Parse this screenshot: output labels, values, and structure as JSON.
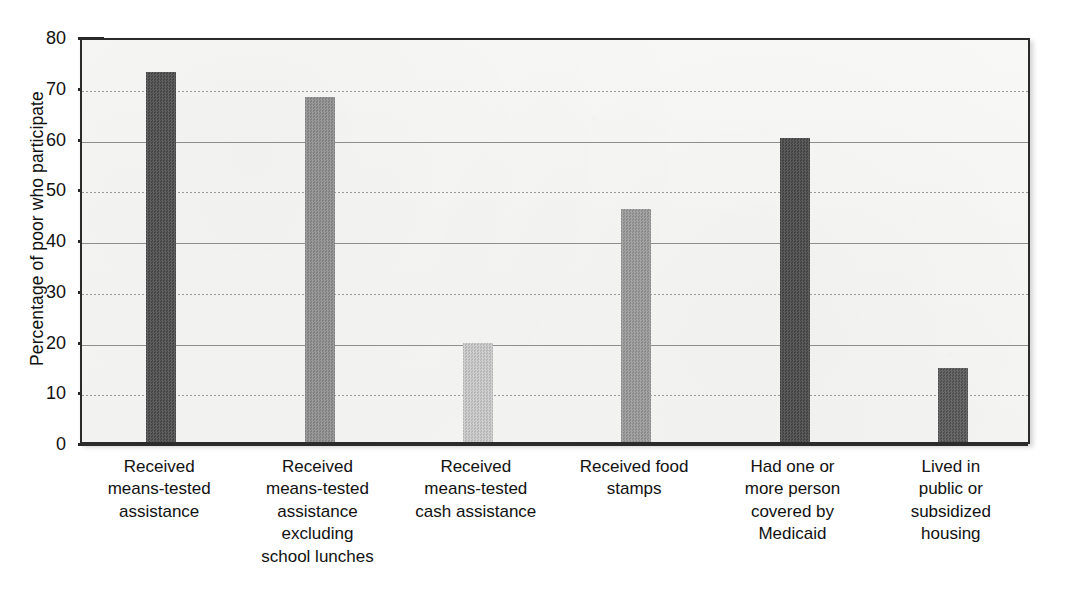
{
  "chart_data": {
    "type": "bar",
    "title": "",
    "xlabel": "",
    "ylabel": "Percentage of poor who participate",
    "ylim": [
      0,
      80
    ],
    "ytick_values": [
      0,
      10,
      20,
      30,
      40,
      50,
      60,
      70,
      80
    ],
    "ytick_labels": [
      "0",
      "10",
      "20",
      "30",
      "40",
      "50",
      "60",
      "70",
      "80"
    ],
    "grid": true,
    "grid_axis": "y",
    "legend": false,
    "categories": [
      "Received means-tested assistance",
      "Received means-tested assistance excluding school lunches",
      "Received means-tested cash assistance",
      "Received food stamps",
      "Had one or more person covered by Medicaid",
      "Lived in public or subsidized housing"
    ],
    "category_label_lines": [
      [
        "Received",
        "means-tested",
        "assistance"
      ],
      [
        "Received",
        "means-tested",
        "assistance",
        "excluding",
        "school lunches"
      ],
      [
        "Received",
        "means-tested",
        "cash assistance"
      ],
      [
        "Received food",
        "stamps"
      ],
      [
        "Had one or",
        "more person",
        "covered by",
        "Medicaid"
      ],
      [
        "Lived in",
        "public or",
        "subsidized",
        "housing"
      ]
    ],
    "values": [
      73,
      68,
      19.5,
      46,
      60,
      14.5
    ],
    "bar_colors": [
      "#4d4d4d",
      "#8f8f8f",
      "#c9c9c9",
      "#9a9a9a",
      "#4a4a4a",
      "#585858"
    ],
    "bars": [
      {
        "category": "Received means-tested assistance",
        "value": 73,
        "color": "#4d4d4d"
      },
      {
        "category": "Received means-tested assistance excluding school lunches",
        "value": 68,
        "color": "#8f8f8f"
      },
      {
        "category": "Received means-tested cash assistance",
        "value": 19.5,
        "color": "#c9c9c9"
      },
      {
        "category": "Received food stamps",
        "value": 46,
        "color": "#9a9a9a"
      },
      {
        "category": "Had one or more person covered by Medicaid",
        "value": 60,
        "color": "#4a4a4a"
      },
      {
        "category": "Lived in public or subsidized housing",
        "value": 14.5,
        "color": "#585858"
      }
    ],
    "plot_background_color": "#f6f6f4",
    "axis_color": "#2b2b2b",
    "gridline_color": "#9a9a9a",
    "text_color": "#111111"
  }
}
